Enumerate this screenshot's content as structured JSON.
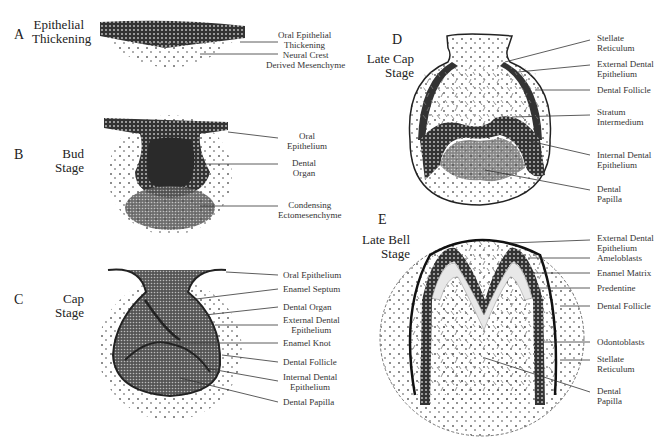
{
  "panels": [
    {
      "letter": "A",
      "stage": [
        "Epithelial",
        "Thickening"
      ],
      "labels": [
        [
          "Oral Epithelial",
          "Thickening"
        ],
        [
          "Neural Crest",
          "Derived Mesenchyme"
        ]
      ]
    },
    {
      "letter": "B",
      "stage": [
        "Bud",
        "Stage"
      ],
      "labels": [
        [
          "Oral",
          "Epithelium"
        ],
        [
          "Dental",
          "Organ"
        ],
        [
          "Condensing",
          "Ectomesenchyme"
        ]
      ]
    },
    {
      "letter": "C",
      "stage": [
        "Cap",
        "Stage"
      ],
      "labels": [
        [
          "Oral Epithelium"
        ],
        [
          "Enamel Septum"
        ],
        [
          "Dental Organ"
        ],
        [
          "External Dental",
          "Epithelium"
        ],
        [
          "Enamel Knot"
        ],
        [
          "Dental Follicle"
        ],
        [
          "Internal Dental",
          "Epithelium"
        ],
        [
          "Dental Papilla"
        ]
      ]
    },
    {
      "letter": "D",
      "stage": [
        "Late Cap",
        "Stage"
      ],
      "labels": [
        [
          "Stellate",
          "Reticulum"
        ],
        [
          "External Dental",
          "Epithelium"
        ],
        [
          "Dental Follicle"
        ],
        [
          "Stratum",
          "Intermedium"
        ],
        [
          "Internal Dental",
          "Epithelium"
        ],
        [
          "Dental",
          "Papilla"
        ]
      ]
    },
    {
      "letter": "E",
      "stage": [
        "Late Bell",
        "Stage"
      ],
      "labels": [
        [
          "External Dental",
          "Epithelium"
        ],
        [
          "Ameloblasts"
        ],
        [
          "Enamel Matrix"
        ],
        [
          "Predentine"
        ],
        [
          "Dental Follicle"
        ],
        [
          "Odontoblasts"
        ],
        [
          "Stellate",
          "Reticulum"
        ],
        [
          "Dental",
          "Papilla"
        ]
      ]
    }
  ]
}
